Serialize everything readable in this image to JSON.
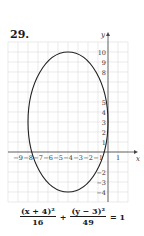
{
  "problem": {
    "number": "29."
  },
  "chart_data": {
    "type": "line",
    "title": "",
    "xlabel": "x",
    "ylabel": "y",
    "grid": true,
    "xlim": [
      -10,
      2
    ],
    "ylim": [
      -5,
      11
    ],
    "x_tick_labels": [
      "-9",
      "-8",
      "-7",
      "-6",
      "-5",
      "-4",
      "-3",
      "-2",
      "-1",
      "1"
    ],
    "y_tick_labels": [
      "10",
      "9",
      "8",
      "5",
      "4",
      "3",
      "2",
      "1",
      "-2",
      "-3",
      "-4"
    ],
    "series": [
      {
        "name": "ellipse",
        "shape": "ellipse",
        "center": [
          -4,
          3
        ],
        "semi_axis_x": 4,
        "semi_axis_y": 7,
        "equation": "(x + 4)^2/16 + (y - 3)^2/49 = 1"
      }
    ]
  },
  "equation": {
    "term1_num": "(x + 4)²",
    "term1_den": "16",
    "plus": "+",
    "term2_num": "(y − 3)²",
    "term2_den": "49",
    "equals": "= 1"
  }
}
